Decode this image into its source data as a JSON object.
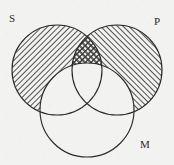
{
  "figure": {
    "kind": "venn-diagram",
    "background_color": "#f2f2f0",
    "stroke_color": "#2b2b2b",
    "hatch_color": "#333333",
    "labels": {
      "S": "S",
      "P": "P",
      "M": "M"
    }
  },
  "chart_data": {
    "type": "diagram",
    "subtype": "three-circle-venn",
    "title": "",
    "sets": [
      {
        "name": "S",
        "label": "S",
        "cx": 57,
        "cy": 70,
        "r": 45,
        "label_x": 9,
        "label_y": 13,
        "fill": "hatch-left",
        "hatch_direction": "backslash"
      },
      {
        "name": "P",
        "label": "P",
        "cx": 117,
        "cy": 70,
        "r": 45,
        "label_x": 154,
        "label_y": 16,
        "fill": "hatch-right",
        "hatch_direction": "forwardslash"
      },
      {
        "name": "M",
        "label": "M",
        "cx": 87,
        "cy": 110,
        "r": 47,
        "label_x": 140,
        "label_y": 139,
        "fill": "none",
        "hatch_direction": "none"
      }
    ],
    "regions": [
      {
        "id": "S-only",
        "sets": [
          "S"
        ],
        "shading": "hatch-backslash"
      },
      {
        "id": "P-only",
        "sets": [
          "P"
        ],
        "shading": "hatch-forwardslash"
      },
      {
        "id": "S-and-P",
        "sets": [
          "S",
          "P"
        ],
        "shading": "cross-hatch"
      },
      {
        "id": "M-only",
        "sets": [
          "M"
        ],
        "shading": "none"
      },
      {
        "id": "S-and-M",
        "sets": [
          "S",
          "M"
        ],
        "shading": "none"
      },
      {
        "id": "P-and-M",
        "sets": [
          "P",
          "M"
        ],
        "shading": "none"
      },
      {
        "id": "S-P-and-M",
        "sets": [
          "S",
          "P",
          "M"
        ],
        "shading": "none"
      }
    ]
  }
}
